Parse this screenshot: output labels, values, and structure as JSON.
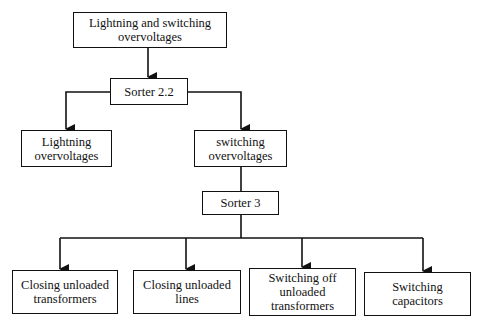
{
  "diagram": {
    "type": "flowchart-tree",
    "nodes": [
      {
        "id": "root",
        "label": "Lightning and switching\novervoltages"
      },
      {
        "id": "sorter22",
        "label": "Sorter 2.2"
      },
      {
        "id": "lightning",
        "label": "Lightning\novervoltages"
      },
      {
        "id": "switching",
        "label": "switching\novervoltages"
      },
      {
        "id": "sorter3",
        "label": "Sorter 3"
      },
      {
        "id": "closing_transformers",
        "label": "Closing unloaded\ntransformers"
      },
      {
        "id": "closing_lines",
        "label": "Closing unloaded\nlines"
      },
      {
        "id": "switching_off",
        "label": "Switching off\nunloaded\ntransformers"
      },
      {
        "id": "switching_capacitors",
        "label": "Switching\ncapacitors"
      }
    ],
    "edges": [
      {
        "from": "root",
        "to": "sorter22",
        "arrow": true
      },
      {
        "from": "sorter22",
        "to": "lightning",
        "arrow": true
      },
      {
        "from": "sorter22",
        "to": "switching",
        "arrow": true
      },
      {
        "from": "switching",
        "to": "sorter3",
        "arrow": false
      },
      {
        "from": "sorter3",
        "to": "closing_transformers",
        "arrow": true
      },
      {
        "from": "sorter3",
        "to": "closing_lines",
        "arrow": true
      },
      {
        "from": "sorter3",
        "to": "switching_off",
        "arrow": true
      },
      {
        "from": "sorter3",
        "to": "switching_capacitors",
        "arrow": true
      }
    ]
  }
}
